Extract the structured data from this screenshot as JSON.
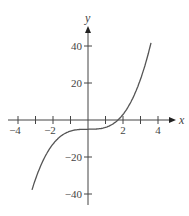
{
  "chart_data": {
    "type": "line",
    "title": "",
    "xlabel": "x",
    "ylabel": "y",
    "xlim": [
      -4.5,
      4.8
    ],
    "ylim": [
      -46,
      50
    ],
    "x_ticks": [
      -4,
      -3,
      -2,
      -1,
      1,
      2,
      3,
      4
    ],
    "x_tick_labels": [
      {
        "value": -4,
        "label": "−4"
      },
      {
        "value": -2,
        "label": "−2"
      },
      {
        "value": 2,
        "label": "2"
      },
      {
        "value": 4,
        "label": "4"
      }
    ],
    "y_ticks": [
      40,
      20,
      -20,
      -40
    ],
    "y_tick_labels": [
      {
        "value": 40,
        "label": "40"
      },
      {
        "value": 20,
        "label": "20"
      },
      {
        "value": -20,
        "label": "−20"
      },
      {
        "value": -40,
        "label": "−40"
      }
    ],
    "grid": false,
    "series": [
      {
        "name": "f(x)",
        "description": "cubic curve, approx y = x^3 - 5",
        "color": "#555555",
        "x": [
          -3.2,
          -2.8,
          -2.4,
          -2.0,
          -1.6,
          -1.2,
          -0.8,
          -0.4,
          0,
          0.4,
          0.8,
          1.2,
          1.6,
          2.0,
          2.4,
          2.8,
          3.2,
          3.6
        ],
        "y": [
          -37.8,
          -27.0,
          -18.8,
          -13.0,
          -9.1,
          -6.7,
          -5.5,
          -5.1,
          -5.0,
          -4.9,
          -4.5,
          -3.3,
          -0.9,
          3.0,
          8.8,
          17.0,
          27.8,
          41.7
        ]
      }
    ]
  },
  "axes": {
    "x_label": "x",
    "y_label": "y",
    "color": "#444444"
  },
  "layout": {
    "origin_px": [
      88,
      120
    ],
    "x_px_per_unit": 17.5,
    "y_px_per_unit": 1.85
  }
}
